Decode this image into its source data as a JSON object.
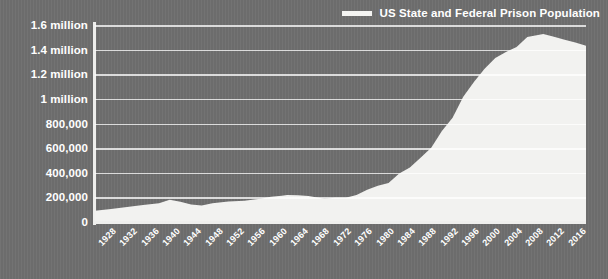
{
  "legend": {
    "position": "top-right",
    "entries": [
      {
        "label": "US State and Federal Prison Population",
        "color": "#f4f4f2",
        "marker": "line-swatch"
      }
    ]
  },
  "colors": {
    "background": "#6e6e6e",
    "area_fill": "#f2f2f0",
    "gridline": "#ffffff",
    "axis": "#efefed",
    "text": "#ffffff"
  },
  "chart_data": {
    "type": "area",
    "title": "",
    "subtitle": "",
    "xlabel": "",
    "ylabel": "",
    "grid": true,
    "legend_position": "top-right",
    "xlim": [
      1925,
      2017
    ],
    "ylim": [
      0,
      1600000
    ],
    "ytick_values": [
      0,
      200000,
      400000,
      600000,
      800000,
      1000000,
      1200000,
      1400000,
      1600000
    ],
    "ytick_labels": [
      "0",
      "200,000",
      "400,000",
      "600,000",
      "800,000",
      "1 million",
      "1.2 million",
      "1.4 million",
      "1.6 million"
    ],
    "xtick_labels": [
      "1928",
      "1932",
      "1936",
      "1940",
      "1944",
      "1948",
      "1952",
      "1956",
      "1960",
      "1964",
      "1968",
      "1972",
      "1976",
      "1980",
      "1984",
      "1988",
      "1992",
      "1996",
      "2000",
      "2004",
      "2008",
      "2012",
      "2016"
    ],
    "series": [
      {
        "name": "US State and Federal Prison Population",
        "color": "#f2f2f0",
        "x": [
          1925,
          1928,
          1931,
          1934,
          1937,
          1939,
          1941,
          1943,
          1945,
          1947,
          1950,
          1953,
          1956,
          1958,
          1960,
          1961,
          1963,
          1965,
          1968,
          1970,
          1972,
          1974,
          1976,
          1978,
          1980,
          1982,
          1984,
          1986,
          1988,
          1990,
          1992,
          1994,
          1996,
          1998,
          2000,
          2002,
          2004,
          2006,
          2008,
          2009,
          2011,
          2013,
          2015,
          2017
        ],
        "y": [
          91669,
          106000,
          122000,
          138000,
          152000,
          179818,
          165000,
          143000,
          133649,
          151304,
          166123,
          173579,
          189735,
          205643,
          212953,
          220149,
          217283,
          210895,
          187914,
          196441,
          196092,
          218466,
          262833,
          294396,
          315974,
          394374,
          443398,
          522084,
          603732,
          739980,
          846277,
          1016691,
          1137722,
          1245402,
          1331278,
          1380516,
          1421345,
          1502179,
          1518559,
          1525920,
          1504150,
          1479840,
          1458173,
          1432000
        ]
      }
    ],
    "annotations": [
      {
        "text": "peak",
        "x": 2009,
        "y": 1525920,
        "visible": false
      }
    ]
  }
}
